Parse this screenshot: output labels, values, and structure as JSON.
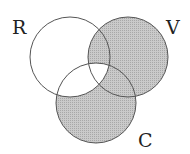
{
  "diagram": {
    "type": "venn-3",
    "sets": [
      {
        "id": "R",
        "label": "R",
        "cx": 70,
        "cy": 57,
        "r": 40
      },
      {
        "id": "V",
        "label": "V",
        "cx": 128,
        "cy": 57,
        "r": 40
      },
      {
        "id": "C",
        "label": "C",
        "cx": 96,
        "cy": 103,
        "r": 40
      }
    ],
    "shaded_regions": [
      "V only",
      "C only",
      "R∩V only",
      "V∩C only"
    ],
    "unshaded_regions": [
      "R only",
      "R∩C only",
      "R∩V∩C"
    ],
    "colors": {
      "shade": "#c6c6c6",
      "shade_dot": "#9a9a9a",
      "stroke": "#555555",
      "background": "#ffffff"
    }
  }
}
